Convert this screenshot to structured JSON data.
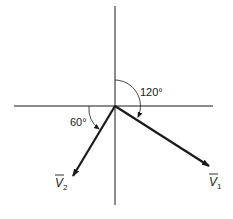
{
  "diagram": {
    "type": "vector-phasor-diagram",
    "axes": {
      "horizontal": {
        "x1": 14,
        "y1": 106,
        "x2": 213,
        "y2": 106
      },
      "vertical": {
        "x1": 115,
        "y1": 6,
        "x2": 115,
        "y2": 205
      },
      "origin": {
        "x": 115,
        "y": 106
      }
    },
    "vectors": [
      {
        "name": "V1",
        "label": "V",
        "subscript": "1",
        "tip": {
          "x": 210,
          "y": 167
        },
        "label_pos": {
          "x": 209,
          "y": 186
        }
      },
      {
        "name": "V2",
        "label": "V",
        "subscript": "2",
        "tip": {
          "x": 72,
          "y": 177
        },
        "label_pos": {
          "x": 55,
          "y": 187
        }
      }
    ],
    "angles": [
      {
        "name": "angle-120",
        "label": "120°",
        "from": "positive vertical axis",
        "to": "V1",
        "label_pos": {
          "x": 140,
          "y": 96
        }
      },
      {
        "name": "angle-60",
        "label": "60°",
        "from": "negative horizontal axis",
        "to": "V2",
        "label_pos": {
          "x": 70,
          "y": 126
        }
      }
    ],
    "colors": {
      "line": "#1a1a1a",
      "background": "#ffffff"
    }
  }
}
